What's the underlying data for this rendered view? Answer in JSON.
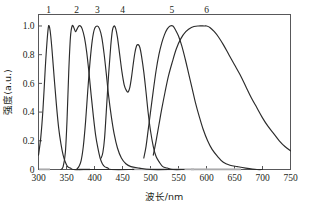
{
  "figure": {
    "background_color": "#ffffff",
    "curve_color": "#2b2b2b",
    "axis_color": "#58585a",
    "width": 309,
    "height": 207
  },
  "chart_data": {
    "type": "line",
    "title": "",
    "xlabel": "波长/nm",
    "ylabel": "强度(a.u.)",
    "xlim": [
      300,
      750
    ],
    "ylim": [
      0,
      1.08
    ],
    "xticks": [
      300,
      350,
      400,
      450,
      500,
      550,
      600,
      650,
      700,
      750
    ],
    "xtick_labels": [
      "300",
      "350",
      "400",
      "450",
      "500",
      "550",
      "600",
      "650",
      "700",
      "750"
    ],
    "yticks": [
      0,
      0.2,
      0.4,
      0.6,
      0.8,
      1.0
    ],
    "ytick_labels": [
      "0",
      "0.2",
      "0.4",
      "0.6",
      "0.8",
      "1.0"
    ],
    "grid": false,
    "legend": "none",
    "annotations": [
      {
        "text": "1",
        "x": 318,
        "y": 1.08
      },
      {
        "text": "2",
        "x": 368,
        "y": 1.08
      },
      {
        "text": "3",
        "x": 405,
        "y": 1.08
      },
      {
        "text": "4",
        "x": 450,
        "y": 1.08
      },
      {
        "text": "5",
        "x": 538,
        "y": 1.08
      },
      {
        "text": "6",
        "x": 600,
        "y": 1.08
      }
    ],
    "series": [
      {
        "name": "1",
        "label": "1",
        "peak_x": 318,
        "peak_y": 1.0,
        "points": [
          [
            300,
            0.1
          ],
          [
            304,
            0.22
          ],
          [
            308,
            0.42
          ],
          [
            312,
            0.7
          ],
          [
            315,
            0.88
          ],
          [
            318,
            1.0
          ],
          [
            321,
            0.96
          ],
          [
            324,
            0.84
          ],
          [
            328,
            0.64
          ],
          [
            332,
            0.45
          ],
          [
            336,
            0.29
          ],
          [
            340,
            0.18
          ],
          [
            344,
            0.1
          ],
          [
            348,
            0.05
          ],
          [
            352,
            0.02
          ],
          [
            357,
            0.01
          ],
          [
            362,
            0.0
          ],
          [
            380,
            0.0
          ],
          [
            420,
            0.0
          ],
          [
            470,
            0.0
          ]
        ]
      },
      {
        "name": "2",
        "label": "2",
        "peak_x": 360,
        "peak_y": 1.0,
        "points": [
          [
            340,
            0.0
          ],
          [
            344,
            0.02
          ],
          [
            348,
            0.12
          ],
          [
            351,
            0.35
          ],
          [
            354,
            0.68
          ],
          [
            357,
            0.92
          ],
          [
            360,
            1.0
          ],
          [
            363,
            0.99
          ],
          [
            366,
            0.96
          ],
          [
            369,
            0.98
          ],
          [
            372,
            1.0
          ],
          [
            375,
            1.0
          ],
          [
            378,
            0.98
          ],
          [
            382,
            0.92
          ],
          [
            386,
            0.82
          ],
          [
            390,
            0.68
          ],
          [
            394,
            0.52
          ],
          [
            398,
            0.37
          ],
          [
            402,
            0.24
          ],
          [
            406,
            0.15
          ],
          [
            410,
            0.08
          ],
          [
            414,
            0.04
          ],
          [
            418,
            0.02
          ],
          [
            424,
            0.01
          ],
          [
            430,
            0.0
          ],
          [
            470,
            0.0
          ]
        ]
      },
      {
        "name": "3",
        "label": "3",
        "peak_x": 405,
        "peak_y": 1.0,
        "points": [
          [
            368,
            0.0
          ],
          [
            372,
            0.02
          ],
          [
            376,
            0.06
          ],
          [
            380,
            0.16
          ],
          [
            384,
            0.33
          ],
          [
            388,
            0.55
          ],
          [
            392,
            0.75
          ],
          [
            396,
            0.9
          ],
          [
            400,
            0.98
          ],
          [
            405,
            1.0
          ],
          [
            409,
            0.98
          ],
          [
            413,
            0.92
          ],
          [
            417,
            0.81
          ],
          [
            421,
            0.67
          ],
          [
            425,
            0.52
          ],
          [
            430,
            0.37
          ],
          [
            435,
            0.25
          ],
          [
            441,
            0.15
          ],
          [
            448,
            0.08
          ],
          [
            456,
            0.04
          ],
          [
            465,
            0.02
          ],
          [
            480,
            0.01
          ],
          [
            500,
            0.0
          ],
          [
            540,
            0.0
          ]
        ]
      },
      {
        "name": "4",
        "label": "4",
        "peak_x": 435,
        "peak_y": 1.0,
        "secondary_peak_x": 477,
        "secondary_peak_y": 0.87,
        "points": [
          [
            412,
            0.08
          ],
          [
            415,
            0.12
          ],
          [
            418,
            0.22
          ],
          [
            421,
            0.4
          ],
          [
            425,
            0.65
          ],
          [
            429,
            0.86
          ],
          [
            432,
            0.97
          ],
          [
            435,
            1.0
          ],
          [
            438,
            0.98
          ],
          [
            441,
            0.92
          ],
          [
            445,
            0.8
          ],
          [
            449,
            0.68
          ],
          [
            453,
            0.59
          ],
          [
            457,
            0.55
          ],
          [
            460,
            0.54
          ],
          [
            463,
            0.57
          ],
          [
            466,
            0.64
          ],
          [
            469,
            0.73
          ],
          [
            472,
            0.81
          ],
          [
            475,
            0.86
          ],
          [
            478,
            0.87
          ],
          [
            481,
            0.85
          ],
          [
            484,
            0.79
          ],
          [
            488,
            0.68
          ],
          [
            492,
            0.54
          ],
          [
            496,
            0.39
          ],
          [
            500,
            0.27
          ],
          [
            505,
            0.16
          ],
          [
            510,
            0.09
          ],
          [
            516,
            0.05
          ],
          [
            522,
            0.02
          ],
          [
            530,
            0.01
          ],
          [
            540,
            0.0
          ],
          [
            560,
            0.0
          ]
        ]
      },
      {
        "name": "5",
        "label": "5",
        "peak_x": 538,
        "peak_y": 1.0,
        "points": [
          [
            488,
            0.08
          ],
          [
            492,
            0.16
          ],
          [
            496,
            0.28
          ],
          [
            500,
            0.4
          ],
          [
            505,
            0.55
          ],
          [
            510,
            0.69
          ],
          [
            515,
            0.8
          ],
          [
            520,
            0.88
          ],
          [
            525,
            0.94
          ],
          [
            530,
            0.98
          ],
          [
            535,
            1.0
          ],
          [
            540,
            1.0
          ],
          [
            545,
            0.97
          ],
          [
            550,
            0.93
          ],
          [
            556,
            0.86
          ],
          [
            562,
            0.77
          ],
          [
            568,
            0.67
          ],
          [
            574,
            0.57
          ],
          [
            580,
            0.47
          ],
          [
            587,
            0.37
          ],
          [
            594,
            0.28
          ],
          [
            602,
            0.2
          ],
          [
            610,
            0.14
          ],
          [
            620,
            0.09
          ],
          [
            630,
            0.05
          ],
          [
            642,
            0.03
          ],
          [
            655,
            0.02
          ],
          [
            670,
            0.01
          ],
          [
            690,
            0.0
          ],
          [
            700,
            0.0
          ]
        ]
      },
      {
        "name": "6",
        "label": "6",
        "peak_x": 600,
        "peak_y": 1.0,
        "points": [
          [
            505,
            0.1
          ],
          [
            510,
            0.2
          ],
          [
            515,
            0.31
          ],
          [
            520,
            0.42
          ],
          [
            526,
            0.54
          ],
          [
            532,
            0.65
          ],
          [
            539,
            0.75
          ],
          [
            546,
            0.84
          ],
          [
            554,
            0.91
          ],
          [
            563,
            0.96
          ],
          [
            573,
            0.99
          ],
          [
            585,
            1.0
          ],
          [
            596,
            1.0
          ],
          [
            600,
            1.0
          ],
          [
            606,
            0.99
          ],
          [
            614,
            0.96
          ],
          [
            622,
            0.92
          ],
          [
            630,
            0.87
          ],
          [
            640,
            0.8
          ],
          [
            650,
            0.73
          ],
          [
            660,
            0.66
          ],
          [
            670,
            0.58
          ],
          [
            680,
            0.5
          ],
          [
            690,
            0.43
          ],
          [
            700,
            0.36
          ],
          [
            710,
            0.3
          ],
          [
            720,
            0.25
          ],
          [
            730,
            0.2
          ],
          [
            740,
            0.16
          ],
          [
            750,
            0.13
          ]
        ]
      }
    ]
  }
}
